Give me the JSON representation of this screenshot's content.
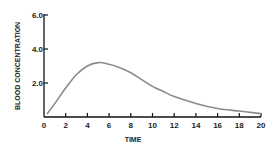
{
  "chart_data": {
    "type": "line",
    "title": "",
    "xlabel": "TIME",
    "ylabel": "BLOOD CONCENTRATION",
    "xlim": [
      0,
      20
    ],
    "ylim": [
      0,
      6.0
    ],
    "x_ticks": [
      "0",
      "2",
      "4",
      "6",
      "8",
      "10",
      "12",
      "14",
      "16",
      "18",
      "20"
    ],
    "y_ticks": [
      "2.0",
      "4.0",
      "6.0"
    ],
    "grid": false,
    "legend": null,
    "series": [
      {
        "name": "Blood concentration",
        "color": "#8a8a8a",
        "x": [
          0.3,
          1,
          2,
          3,
          4,
          5,
          6,
          7,
          8,
          9,
          10,
          11,
          12,
          14,
          16,
          18,
          20
        ],
        "y": [
          0.2,
          0.8,
          1.7,
          2.5,
          3.0,
          3.2,
          3.1,
          2.9,
          2.6,
          2.2,
          1.8,
          1.5,
          1.2,
          0.8,
          0.5,
          0.35,
          0.2
        ]
      }
    ]
  },
  "colors": {
    "axis": "#111111",
    "curve": "#8a8a8a",
    "background": "#ffffff"
  }
}
